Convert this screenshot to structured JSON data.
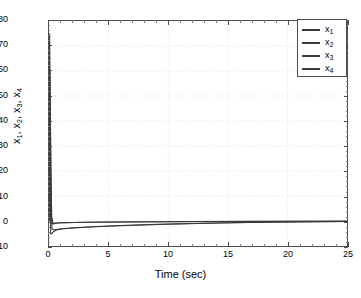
{
  "chart_data": {
    "type": "line",
    "title": "",
    "xlabel": "Time (sec)",
    "ylabel": "x_1, x_2, x_3, x_4",
    "xlim": [
      0,
      25
    ],
    "ylim": [
      -10,
      80
    ],
    "xticks": [
      0,
      5,
      10,
      15,
      20,
      25
    ],
    "yticks": [
      -10,
      0,
      10,
      20,
      30,
      40,
      50,
      60,
      70,
      80
    ],
    "grid": true,
    "legend_position": "upper right",
    "legend_entries": [
      "x1",
      "x2",
      "x3",
      "x4"
    ],
    "series": [
      {
        "name": "x1",
        "color": "#3a3a3a",
        "x": [
          0,
          0.05,
          0.12,
          0.2,
          0.35,
          0.5,
          0.8,
          1.2,
          2,
          3,
          5,
          8,
          12,
          17,
          21,
          25
        ],
        "values": [
          0,
          75,
          40,
          2,
          -1.2,
          -1,
          -0.8,
          -0.7,
          -0.6,
          -0.5,
          -0.4,
          -0.3,
          -0.2,
          -0.15,
          -0.1,
          -0.1
        ]
      },
      {
        "name": "x2",
        "color": "#3a3a3a",
        "x": [
          0,
          0.08,
          0.15,
          0.25,
          0.4,
          0.6,
          1,
          1.5,
          2.5,
          4,
          6,
          9,
          13,
          18,
          22,
          25
        ],
        "values": [
          0,
          60,
          20,
          -3.2,
          -3.6,
          -3.4,
          -3.1,
          -2.9,
          -2.6,
          -2.2,
          -1.8,
          -1.3,
          -0.9,
          -0.5,
          -0.3,
          -0.2
        ]
      },
      {
        "name": "x3",
        "color": "#3a3a3a",
        "x": [
          0,
          0.06,
          0.14,
          0.22,
          0.3,
          0.45,
          0.7,
          1.1,
          2,
          3.5,
          6,
          10,
          15,
          20,
          25
        ],
        "values": [
          0,
          45,
          -5,
          -5.2,
          -4.6,
          -4.0,
          -3.5,
          -3.2,
          -2.8,
          -2.4,
          -1.9,
          -1.3,
          -0.7,
          -0.35,
          -0.15
        ]
      },
      {
        "name": "x4",
        "color": "#3a3a3a",
        "x": [
          0,
          0.1,
          0.18,
          0.3,
          0.5,
          0.9,
          1.4,
          2.2,
          4,
          7,
          11,
          16,
          21,
          25
        ],
        "values": [
          0,
          30,
          -1.0,
          -0.9,
          -0.8,
          -0.7,
          -0.65,
          -0.6,
          -0.5,
          -0.4,
          -0.3,
          -0.2,
          -0.12,
          -0.08
        ]
      }
    ]
  },
  "axis": {
    "x_label": "Time (sec)",
    "y_label_parts": [
      "x",
      "1",
      ", x",
      "2",
      ", x",
      "3",
      ", x",
      "4"
    ],
    "x_tick_labels": [
      "0",
      "5",
      "10",
      "15",
      "20",
      "25"
    ],
    "y_tick_labels": [
      "-10",
      "0",
      "10",
      "20",
      "30",
      "40",
      "50",
      "60",
      "70",
      "80"
    ]
  },
  "legend": {
    "items": [
      {
        "base": "x",
        "sub": "1"
      },
      {
        "base": "x",
        "sub": "2"
      },
      {
        "base": "x",
        "sub": "3"
      },
      {
        "base": "x",
        "sub": "4"
      }
    ]
  },
  "colors": {
    "line": "#3a3a3a",
    "axis": "#4d4d4d",
    "grid": "#d9d9d9",
    "background": "#ffffff"
  }
}
